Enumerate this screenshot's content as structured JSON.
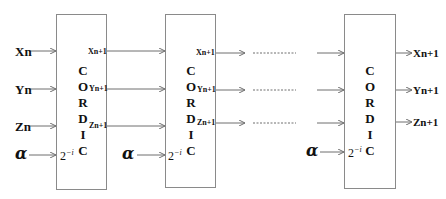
{
  "diagram": {
    "type": "cordic-pipeline",
    "inputs": {
      "x": "Xn",
      "y": "Yn",
      "z": "Zn",
      "alpha": "α"
    },
    "stages": [
      {
        "title_letters": [
          "C",
          "O",
          "R",
          "D",
          "I",
          "C"
        ],
        "shift": "2",
        "shift_exp": "−i",
        "outputs": {
          "x": "Xn+1",
          "y": "Yn+1",
          "z": "Zn+1"
        },
        "alpha": "α"
      },
      {
        "title_letters": [
          "C",
          "O",
          "R",
          "D",
          "I",
          "C"
        ],
        "shift": "2",
        "shift_exp": "−i",
        "outputs": {
          "x": "Xn+1",
          "y": "Yn+1",
          "z": "Zn+1"
        },
        "alpha": "α"
      },
      {
        "title_letters": [
          "C",
          "O",
          "R",
          "D",
          "I",
          "C"
        ],
        "shift": "2",
        "shift_exp": "−i",
        "outputs": {
          "x": "Xn+1",
          "y": "Yn+1",
          "z": "Zn+1"
        },
        "alpha": "α"
      }
    ],
    "final_outputs": {
      "x": "Xn+1",
      "y": "Yn+1",
      "z": "Zn+1"
    },
    "colors": {
      "line": "#6f6f6f",
      "box_border": "#8a8a8a",
      "text": "#111111"
    }
  }
}
